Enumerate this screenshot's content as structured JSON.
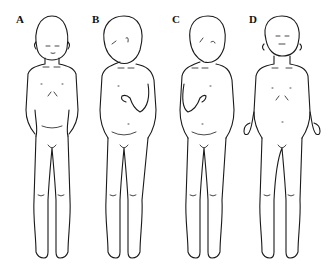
{
  "figure": {
    "type": "medical line illustration",
    "panels": [
      {
        "label": "A",
        "pose": "head upright, eyes closed, hands clasped over groin"
      },
      {
        "label": "B",
        "pose": "head turned/tilted to the right, left hand held on chest"
      },
      {
        "label": "C",
        "pose": "head turned/tilted to the right, right hand held on chest"
      },
      {
        "label": "D",
        "pose": "head upright, eyes closed, arms down with hands flexed outward"
      }
    ]
  }
}
